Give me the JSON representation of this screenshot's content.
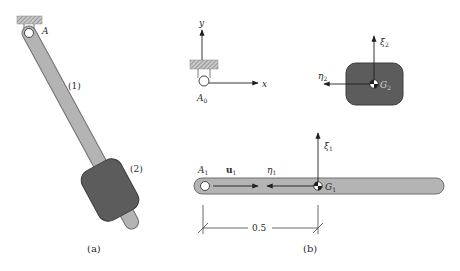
{
  "figure": {
    "panel_a": {
      "caption": "(a)",
      "pivot_label": "A",
      "body1_label": "(1)",
      "body2_label": "(2)"
    },
    "panel_b": {
      "caption": "(b)",
      "ground": {
        "origin_label": "A",
        "origin_sub": "0",
        "x_axis_label": "x",
        "y_axis_label": "y"
      },
      "body2": {
        "xi_label": "ξ",
        "xi_sub": "2",
        "eta_label": "η",
        "eta_sub": "2",
        "cg_label": "G",
        "cg_sub": "2"
      },
      "body1": {
        "pivot_label": "A",
        "pivot_sub": "1",
        "unit_vector_label": "u",
        "unit_vector_sub": "1",
        "eta_label": "η",
        "eta_sub": "1",
        "xi_label": "ξ",
        "xi_sub": "1",
        "cg_label": "G",
        "cg_sub": "1",
        "dimension": "0.5"
      }
    },
    "colors": {
      "bar_fill": "#b4b4b4",
      "bar_stroke": "#6e6e6e",
      "block_fill": "#5c5c5c",
      "block_stroke": "#3c3c3c",
      "line": "#1e1e1e",
      "hatch": "#9a9a9a"
    }
  }
}
